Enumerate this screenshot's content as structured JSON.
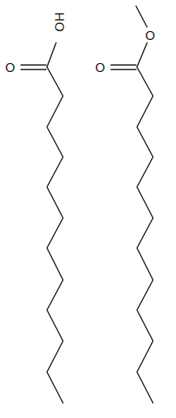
{
  "diagram": {
    "type": "skeletal-structure",
    "molecules": [
      {
        "name": "dodecanoic-acid",
        "functional_group_labels": {
          "hydroxyl": "HO",
          "carbonyl_oxygen": "O"
        },
        "chain_carbons": 12,
        "carbonyl_carbon": [
          47,
          67
        ],
        "carbonyl_oxygen_pos": [
          11,
          67
        ],
        "hydroxyl_label_pos": [
          60,
          26
        ],
        "chain_vertices": [
          [
            47,
            67
          ],
          [
            63,
            96
          ],
          [
            47,
            127
          ],
          [
            63,
            157
          ],
          [
            47,
            187
          ],
          [
            63,
            218
          ],
          [
            47,
            248
          ],
          [
            63,
            280
          ],
          [
            47,
            310
          ],
          [
            63,
            341
          ],
          [
            47,
            372
          ],
          [
            63,
            403
          ]
        ]
      },
      {
        "name": "methyl-dodecanoate",
        "functional_group_labels": {
          "ester_oxygen": "O",
          "carbonyl_oxygen": "O"
        },
        "chain_carbons": 12,
        "methyl_end": [
          136,
          6
        ],
        "ester_oxygen_pos": [
          151,
          35
        ],
        "carbonyl_carbon": [
          137,
          67
        ],
        "carbonyl_oxygen_pos": [
          101,
          67
        ],
        "chain_vertices": [
          [
            137,
            67
          ],
          [
            153,
            96
          ],
          [
            137,
            127
          ],
          [
            153,
            157
          ],
          [
            137,
            187
          ],
          [
            153,
            218
          ],
          [
            137,
            248
          ],
          [
            153,
            280
          ],
          [
            137,
            310
          ],
          [
            153,
            341
          ],
          [
            137,
            372
          ],
          [
            153,
            403
          ]
        ]
      }
    ],
    "colors": {
      "bond": "#3a3a3a",
      "label": "#2a2a2a",
      "background": "#ffffff"
    }
  }
}
